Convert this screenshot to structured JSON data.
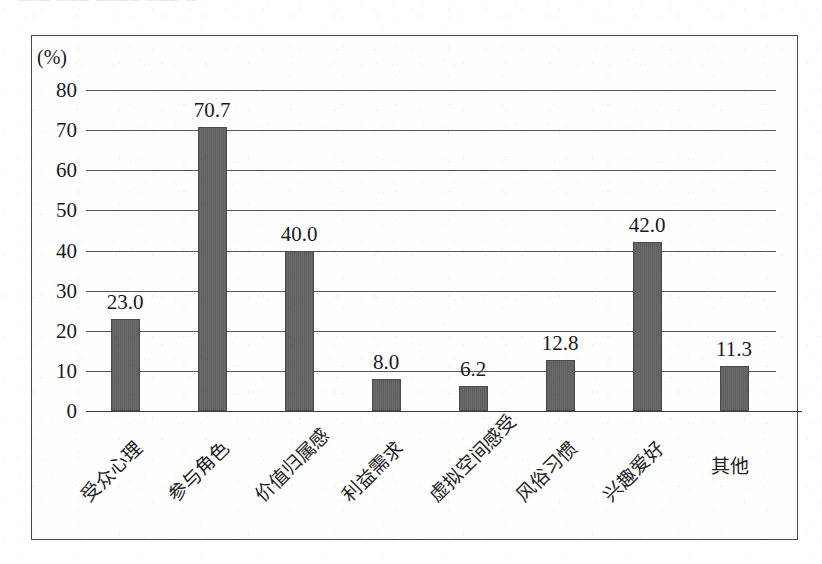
{
  "scan": {
    "top_cropped_text": "□□□ □□□ □□□□ □□□ □"
  },
  "chart_data": {
    "type": "bar",
    "title": "",
    "subtitle": "",
    "xlabel": "",
    "ylabel": "",
    "unit_label": "(%)",
    "categories": [
      "受众心理",
      "参与角色",
      "价值归属感",
      "利益需求",
      "虚拟空间感受",
      "风俗习惯",
      "兴趣爱好",
      "其他"
    ],
    "values": [
      23.0,
      70.7,
      40.0,
      8.0,
      6.2,
      12.8,
      42.0,
      11.3
    ],
    "value_labels": [
      "23.0",
      "70.7",
      "40.0",
      "8.0",
      "6.2",
      "12.8",
      "42.0",
      "11.3"
    ],
    "ylim": [
      0,
      80
    ],
    "ytick_values": [
      0,
      10,
      20,
      30,
      40,
      50,
      60,
      70,
      80
    ],
    "ytick_labels": [
      "0",
      "10",
      "20",
      "30",
      "40",
      "50",
      "60",
      "70",
      "80"
    ],
    "grid": true,
    "grid_axis": "y",
    "legend": false,
    "legend_position": "none",
    "bar_color": "#636363",
    "bar_edge_color": "#4b4b4b",
    "grid_color": "#555555",
    "axis_color": "#3d3d3d",
    "frame_color": "#4a4a4a",
    "background_color": "#fefefe",
    "category_label_rotation_deg": -45
  }
}
